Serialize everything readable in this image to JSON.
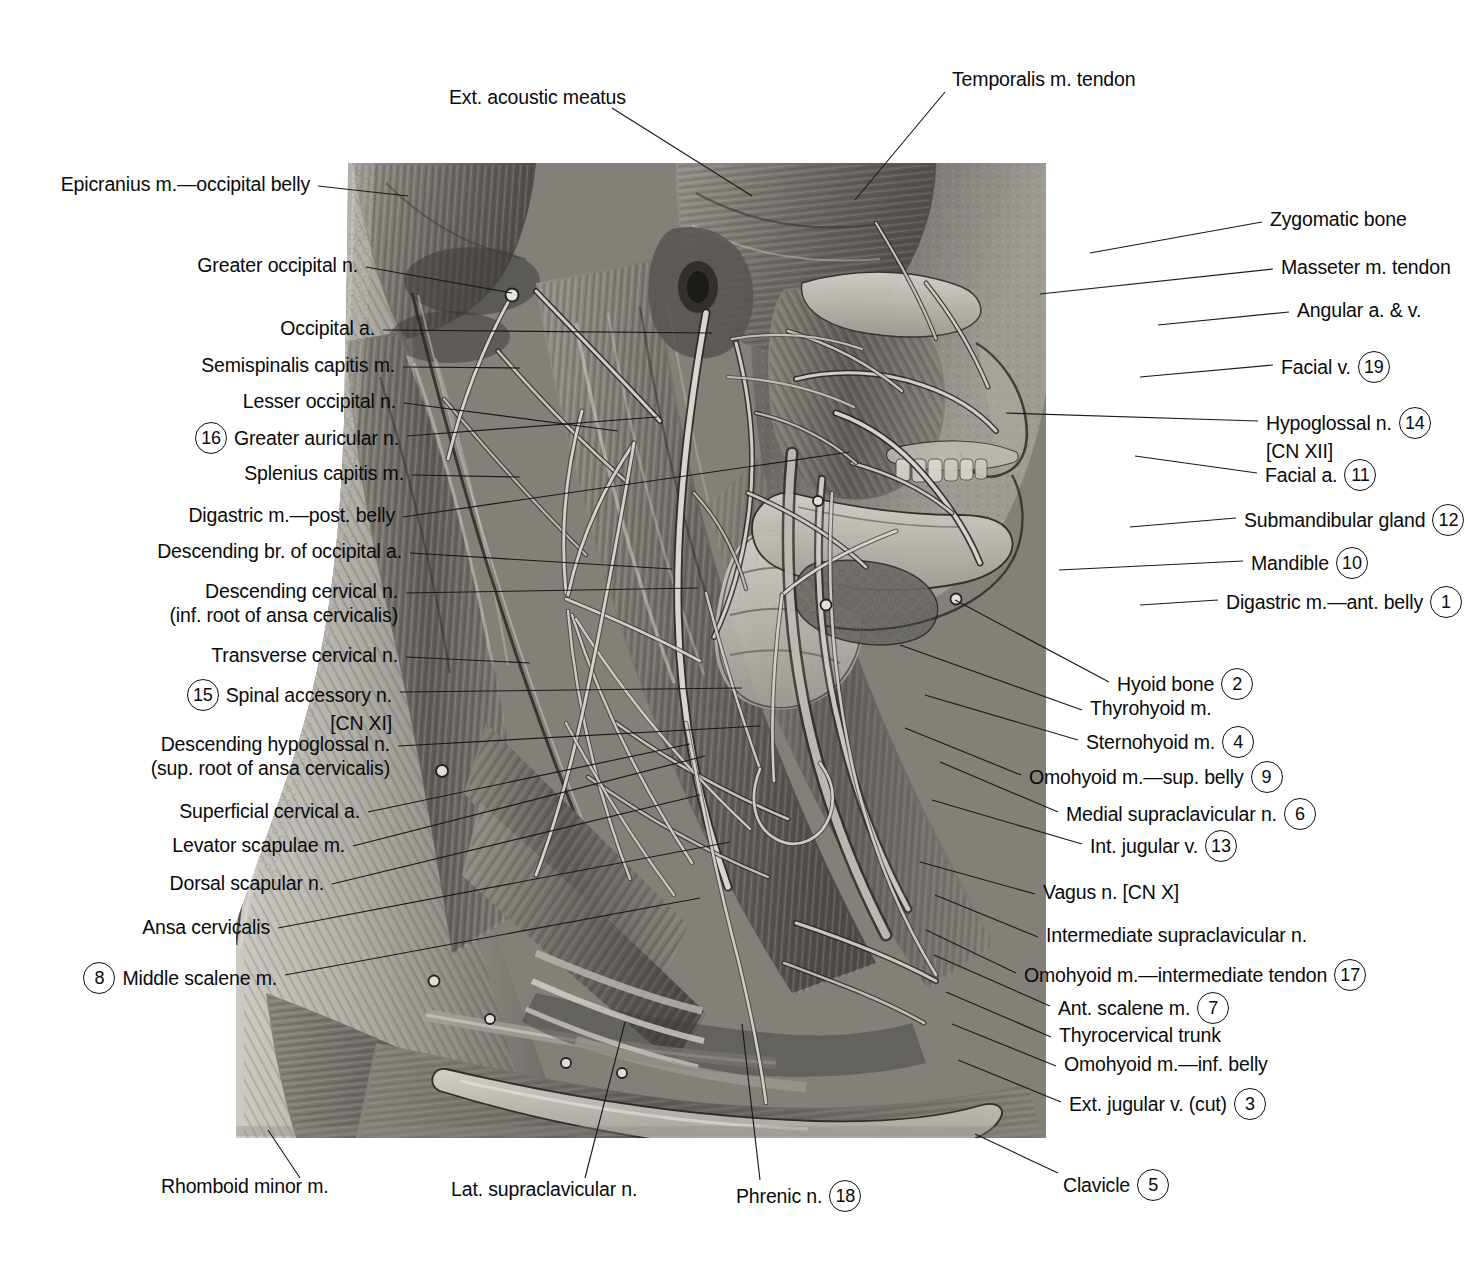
{
  "plate": {
    "title": "Neck — lateral (superficial) dissection",
    "ink": "#0a0a0a",
    "background": "#ffffff"
  },
  "top_labels": [
    {
      "text": "Ext. acoustic meatus",
      "x": 449,
      "y": 97,
      "align": "left",
      "leader": [
        612,
        108,
        752,
        196
      ]
    },
    {
      "text": "Temporalis m. tendon",
      "x": 952,
      "y": 79,
      "align": "left",
      "leader": [
        945,
        92,
        855,
        200
      ]
    }
  ],
  "left_labels": [
    {
      "text": "Epicranius m.—occipital belly",
      "num": null,
      "x": 310,
      "y": 184,
      "leader": [
        318,
        186,
        408,
        196
      ]
    },
    {
      "text": "Greater occipital n.",
      "num": null,
      "x": 358,
      "y": 265,
      "leader": [
        366,
        267,
        512,
        293
      ]
    },
    {
      "text": "Occipital a.",
      "num": null,
      "x": 375,
      "y": 328,
      "leader": [
        383,
        330,
        712,
        333
      ]
    },
    {
      "text": "Semispinalis capitis m.",
      "num": null,
      "x": 395,
      "y": 365,
      "leader": [
        403,
        367,
        520,
        368
      ]
    },
    {
      "text": "Lesser occipital n.",
      "num": null,
      "x": 396,
      "y": 401,
      "leader": [
        404,
        403,
        618,
        431
      ]
    },
    {
      "text": "Greater auricular n.",
      "num": "16",
      "x": 399,
      "y": 434,
      "leader": [
        407,
        436,
        657,
        417
      ]
    },
    {
      "text": "Splenius capitis m.",
      "num": null,
      "x": 404,
      "y": 473,
      "leader": [
        412,
        475,
        520,
        477
      ]
    },
    {
      "text": "Digastric m.—post. belly",
      "num": null,
      "x": 395,
      "y": 515,
      "leader": [
        403,
        517,
        850,
        452
      ]
    },
    {
      "text": "Descending br. of occipital a.",
      "num": null,
      "x": 402,
      "y": 551,
      "leader": [
        410,
        553,
        672,
        569
      ]
    },
    {
      "text": "Descending cervical n.",
      "sub": "(inf. root of ansa cervicalis)",
      "num": null,
      "x": 398,
      "y": 591,
      "leader": [
        406,
        593,
        698,
        588
      ]
    },
    {
      "text": "Transverse cervical n.",
      "num": null,
      "x": 398,
      "y": 655,
      "leader": [
        406,
        657,
        530,
        663
      ]
    },
    {
      "text": "Spinal accessory n.",
      "sub": "[CN XI]",
      "num": "15",
      "x": 392,
      "y": 691,
      "leader": [
        400,
        692,
        742,
        688
      ]
    },
    {
      "text": "Descending hypoglossal n.",
      "sub": "(sup. root of ansa cervicalis)",
      "num": null,
      "x": 390,
      "y": 744,
      "leader": [
        398,
        746,
        760,
        726
      ]
    },
    {
      "text": "Superficial cervical a.",
      "num": null,
      "x": 360,
      "y": 811,
      "leader": [
        368,
        812,
        690,
        744
      ]
    },
    {
      "text": "Levator scapulae m.",
      "num": null,
      "x": 345,
      "y": 845,
      "leader": [
        353,
        846,
        705,
        756
      ]
    },
    {
      "text": "Dorsal scapular n.",
      "num": null,
      "x": 324,
      "y": 883,
      "leader": [
        332,
        884,
        700,
        795
      ]
    },
    {
      "text": "Ansa cervicalis",
      "num": null,
      "x": 270,
      "y": 927,
      "leader": [
        278,
        928,
        730,
        842
      ]
    },
    {
      "text": "Middle scalene m.",
      "num": "8",
      "x": 277,
      "y": 974,
      "leader": [
        285,
        975,
        700,
        898
      ]
    }
  ],
  "right_labels": [
    {
      "text": "Zygomatic bone",
      "num": null,
      "x": 1270,
      "y": 219,
      "leader": [
        1090,
        253,
        1262,
        222
      ]
    },
    {
      "text": "Masseter m. tendon",
      "num": null,
      "x": 1281,
      "y": 267,
      "leader": [
        1040,
        294,
        1273,
        269
      ]
    },
    {
      "text": "Angular a. & v.",
      "num": null,
      "x": 1297,
      "y": 310,
      "leader": [
        1158,
        325,
        1289,
        312
      ]
    },
    {
      "text": "Facial v.",
      "num": "19",
      "x": 1281,
      "y": 363,
      "leader": [
        1140,
        377,
        1273,
        365
      ]
    },
    {
      "text": "Hypoglossal n.",
      "sub": "[CN XII]",
      "num": "14",
      "x": 1266,
      "y": 419,
      "leader": [
        1006,
        413,
        1258,
        421
      ]
    },
    {
      "text": "Facial a.",
      "num": "11",
      "x": 1265,
      "y": 471,
      "leader": [
        1135,
        456,
        1257,
        473
      ]
    },
    {
      "text": "Submandibular gland",
      "num": "12",
      "x": 1244,
      "y": 516,
      "leader": [
        1130,
        527,
        1236,
        518
      ]
    },
    {
      "text": "Mandible",
      "num": "10",
      "x": 1251,
      "y": 559,
      "leader": [
        1059,
        570,
        1243,
        561
      ]
    },
    {
      "text": "Digastric m.—ant. belly",
      "num": "1",
      "x": 1226,
      "y": 598,
      "leader": [
        1140,
        605,
        1218,
        600
      ]
    },
    {
      "text": "Hyoid bone",
      "num": "2",
      "x": 1117,
      "y": 680,
      "leader": [
        955,
        600,
        1109,
        682
      ]
    },
    {
      "text": "Thyrohyoid m.",
      "num": null,
      "x": 1090,
      "y": 708,
      "leader": [
        900,
        645,
        1082,
        710
      ]
    },
    {
      "text": "Sternohyoid m.",
      "num": "4",
      "x": 1086,
      "y": 738,
      "leader": [
        925,
        695,
        1078,
        740
      ]
    },
    {
      "text": "Omohyoid m.—sup. belly",
      "num": "9",
      "x": 1029,
      "y": 773,
      "leader": [
        905,
        728,
        1021,
        775
      ]
    },
    {
      "text": "Medial supraclavicular n.",
      "num": "6",
      "x": 1066,
      "y": 810,
      "leader": [
        940,
        762,
        1058,
        812
      ]
    },
    {
      "text": "Int. jugular v.",
      "num": "13",
      "x": 1090,
      "y": 842,
      "leader": [
        932,
        800,
        1082,
        844
      ]
    },
    {
      "text": "Vagus n. [CN X]",
      "num": null,
      "x": 1043,
      "y": 892,
      "leader": [
        920,
        862,
        1035,
        894
      ]
    },
    {
      "text": "Intermediate supraclavicular n.",
      "num": null,
      "x": 1046,
      "y": 935,
      "leader": [
        935,
        895,
        1038,
        937
      ]
    },
    {
      "text": "Omohyoid m.—intermediate tendon",
      "num": "17",
      "x": 1024,
      "y": 971,
      "leader": [
        926,
        930,
        1016,
        973
      ]
    },
    {
      "text": "Ant. scalene m.",
      "num": "7",
      "x": 1058,
      "y": 1004,
      "leader": [
        934,
        955,
        1050,
        1006
      ]
    },
    {
      "text": "Thyrocervical trunk",
      "num": null,
      "x": 1059,
      "y": 1035,
      "leader": [
        946,
        992,
        1051,
        1037
      ]
    },
    {
      "text": "Omohyoid m.—inf. belly",
      "num": null,
      "x": 1064,
      "y": 1064,
      "leader": [
        952,
        1024,
        1056,
        1066
      ]
    },
    {
      "text": "Ext. jugular v. (cut)",
      "num": "3",
      "x": 1069,
      "y": 1100,
      "leader": [
        958,
        1060,
        1061,
        1102
      ]
    }
  ],
  "bottom_labels": [
    {
      "text": "Rhomboid minor m.",
      "num": null,
      "x": 161,
      "y": 1186,
      "align": "left",
      "leader": [
        300,
        1178,
        268,
        1130
      ]
    },
    {
      "text": "Lat. supraclavicular n.",
      "num": null,
      "x": 451,
      "y": 1189,
      "align": "left",
      "leader": [
        585,
        1178,
        625,
        1022
      ]
    },
    {
      "text": "Phrenic n.",
      "num": "18",
      "x": 736,
      "y": 1192,
      "align": "left",
      "leader": [
        760,
        1180,
        742,
        1024
      ]
    },
    {
      "text": "Clavicle",
      "num": "5",
      "x": 1063,
      "y": 1181,
      "align": "left",
      "leader": [
        1058,
        1173,
        975,
        1134
      ]
    }
  ]
}
